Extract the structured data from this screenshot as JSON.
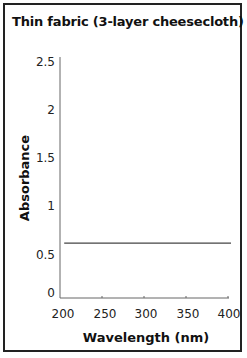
{
  "chart_data": {
    "type": "line",
    "title": "Thin fabric (3-layer cheesecloth)",
    "xlabel": "Wavelength (nm)",
    "ylabel": "Absorbance",
    "xlim": [
      200,
      400
    ],
    "ylim": [
      0,
      2.5
    ],
    "x_ticks": [
      "200",
      "250",
      "300",
      "350",
      "400"
    ],
    "y_ticks": [
      "0",
      "0.5",
      "1",
      "1.5",
      "2",
      "2.5"
    ],
    "grid": false,
    "legend": null,
    "series": [
      {
        "name": "Thin fabric (3-layer cheesecloth)",
        "x": [
          205,
          400
        ],
        "values": [
          0.57,
          0.57
        ],
        "color": "#444444"
      }
    ]
  },
  "colors": {
    "line": "#444444",
    "axis": "#555555",
    "border": "#222222"
  }
}
